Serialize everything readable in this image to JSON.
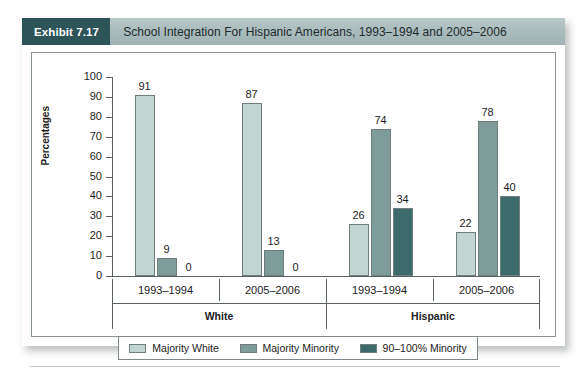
{
  "exhibit": {
    "badge": "Exhibit 7.17",
    "title": "School Integration For Hispanic Americans, 1993–1994 and 2005–2006"
  },
  "colors": {
    "series_light": "#c3d5d3",
    "series_medium": "#7d9c9a",
    "series_dark": "#3d6b6b",
    "badge_bg": "#2d5558",
    "header_bg": "#aabbbc",
    "axis": "#5a6263"
  },
  "chart_data": {
    "type": "bar",
    "title": "School Integration For Hispanic Americans, 1993–1994 and 2005–2006",
    "xlabel": "",
    "ylabel": "Percentages",
    "ylim": [
      0,
      100
    ],
    "ytick_step": 10,
    "yticks": [
      0,
      10,
      20,
      30,
      40,
      50,
      60,
      70,
      80,
      90,
      100
    ],
    "grid": false,
    "legend_position": "bottom",
    "groups": [
      "White",
      "Hispanic"
    ],
    "categories": [
      "1993–1994",
      "2005–2006",
      "1993–1994",
      "2005–2006"
    ],
    "category_groups": [
      "White",
      "White",
      "Hispanic",
      "Hispanic"
    ],
    "series": [
      {
        "name": "Majority White",
        "color": "#c3d5d3",
        "values": [
          91,
          87,
          26,
          22
        ]
      },
      {
        "name": "Majority Minority",
        "color": "#7d9c9a",
        "values": [
          9,
          13,
          74,
          78
        ]
      },
      {
        "name": "90–100% Minority",
        "color": "#3d6b6b",
        "values": [
          0,
          0,
          34,
          40
        ]
      }
    ]
  },
  "legend": [
    {
      "label": "Majority White",
      "color": "#c3d5d3"
    },
    {
      "label": "Majority Minority",
      "color": "#7d9c9a"
    },
    {
      "label": "90–100% Minority",
      "color": "#3d6b6b"
    }
  ]
}
